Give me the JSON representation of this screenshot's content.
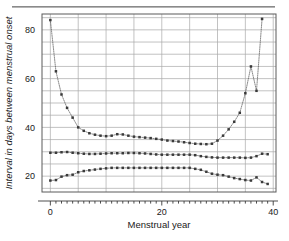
{
  "figure": {
    "has_top_rule": true,
    "background": "#ffffff",
    "frame_color": "#5a5a5a",
    "grid_color": "#a8a8a8",
    "series_color": "#3a3a3a"
  },
  "chart_data": {
    "type": "line",
    "title": "",
    "xlabel": "Menstrual year",
    "ylabel": "Interval in days between menstrual onset",
    "xlim": [
      -1.5,
      40.5
    ],
    "ylim": [
      13.5,
      86.5
    ],
    "xticks": [
      0,
      5,
      10,
      15,
      20,
      25,
      30,
      35,
      40
    ],
    "xticklabels": [
      "0",
      "",
      "",
      "",
      "20",
      "",
      "",
      "",
      "40"
    ],
    "xminor_tick_step": 1,
    "yticks": [
      15,
      20,
      25,
      30,
      35,
      40,
      45,
      50,
      55,
      60,
      65,
      70,
      75,
      80,
      85
    ],
    "yticklabels": [
      "",
      "20",
      "",
      "",
      "",
      "40",
      "",
      "",
      "",
      "60",
      "",
      "",
      "",
      "80",
      ""
    ],
    "grid": true,
    "grid_axis": "both",
    "legend": "none",
    "marker": "square",
    "linestyle": "dotted",
    "x": [
      0,
      1,
      2,
      3,
      4,
      5,
      6,
      7,
      8,
      9,
      10,
      11,
      12,
      13,
      14,
      15,
      16,
      17,
      18,
      19,
      20,
      21,
      22,
      23,
      24,
      25,
      26,
      27,
      28,
      29,
      30,
      31,
      32,
      33,
      34,
      35,
      36,
      37,
      38,
      39
    ],
    "series": [
      {
        "name": "upper percentile",
        "values": [
          84.0,
          63.0,
          53.5,
          48.0,
          44.0,
          40.0,
          38.6,
          37.6,
          37.0,
          36.6,
          36.4,
          36.6,
          37.2,
          37.1,
          36.6,
          36.2,
          36.0,
          35.8,
          35.6,
          35.3,
          35.0,
          34.6,
          34.4,
          34.2,
          33.9,
          33.6,
          33.3,
          33.2,
          33.1,
          33.3,
          34.6,
          36.6,
          39.2,
          42.3,
          46.0,
          54.0,
          65.0,
          55.0,
          84.5,
          null
        ]
      },
      {
        "name": "median percentile",
        "values": [
          29.6,
          29.6,
          29.8,
          29.9,
          29.6,
          29.4,
          29.2,
          29.1,
          29.1,
          29.2,
          29.3,
          29.4,
          29.4,
          29.4,
          29.5,
          29.5,
          29.4,
          29.3,
          29.1,
          28.9,
          28.8,
          28.8,
          28.8,
          28.8,
          28.8,
          28.8,
          28.6,
          28.2,
          27.9,
          27.7,
          27.6,
          27.6,
          27.6,
          27.6,
          27.6,
          27.5,
          27.6,
          28.2,
          29.2,
          29.0
        ]
      },
      {
        "name": "lower percentile",
        "values": [
          18.2,
          18.4,
          19.8,
          20.4,
          20.6,
          21.6,
          22.1,
          22.4,
          22.7,
          23.0,
          23.2,
          23.4,
          23.4,
          23.4,
          23.4,
          23.4,
          23.4,
          23.4,
          23.4,
          23.4,
          23.4,
          23.4,
          23.4,
          23.4,
          23.4,
          23.4,
          23.0,
          22.6,
          21.8,
          21.0,
          20.6,
          20.4,
          19.8,
          19.2,
          18.8,
          18.4,
          18.2,
          19.5,
          17.6,
          16.8
        ]
      }
    ]
  }
}
